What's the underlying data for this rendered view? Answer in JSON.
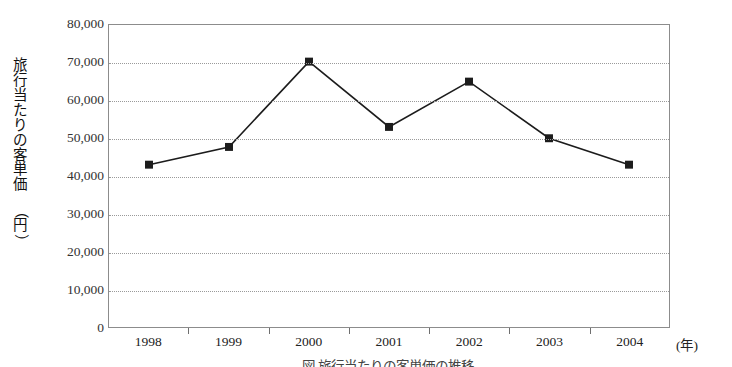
{
  "chart_data": {
    "type": "line",
    "title": "",
    "xlabel": "(年)",
    "ylabel": "旅行当たりの客単価（円）",
    "categories": [
      "1998",
      "1999",
      "2000",
      "2001",
      "2002",
      "2003",
      "2004"
    ],
    "values": [
      43000,
      47700,
      70300,
      53000,
      65000,
      50000,
      43000
    ],
    "series": [
      {
        "name": "旅行当たりの客単価",
        "values": [
          43000,
          47700,
          70300,
          53000,
          65000,
          50000,
          43000
        ]
      }
    ],
    "ylim": [
      0,
      80000
    ],
    "yticks": [
      0,
      10000,
      20000,
      30000,
      40000,
      50000,
      60000,
      70000,
      80000
    ],
    "ytick_labels": [
      "0",
      "10,000",
      "20,000",
      "30,000",
      "40,000",
      "50,000",
      "60,000",
      "70,000",
      "80,000"
    ],
    "grid": true,
    "grid_axis": "y",
    "grid_style": "dotted",
    "legend": false,
    "legend_position": "none",
    "marker": "square",
    "line_color": "#1c1c1c",
    "marker_color": "#1c1c1c"
  },
  "axes": {
    "y_unit_label": "（円）",
    "y_title_chars": [
      "旅",
      "行",
      "当",
      "た",
      "り",
      "の",
      "客",
      "単",
      "価"
    ],
    "y_unit_chars": [
      "（",
      "円",
      "）"
    ],
    "x_unit_label": "(年)"
  },
  "caption": {
    "text": "図 旅行当たりの客単価の推移"
  }
}
